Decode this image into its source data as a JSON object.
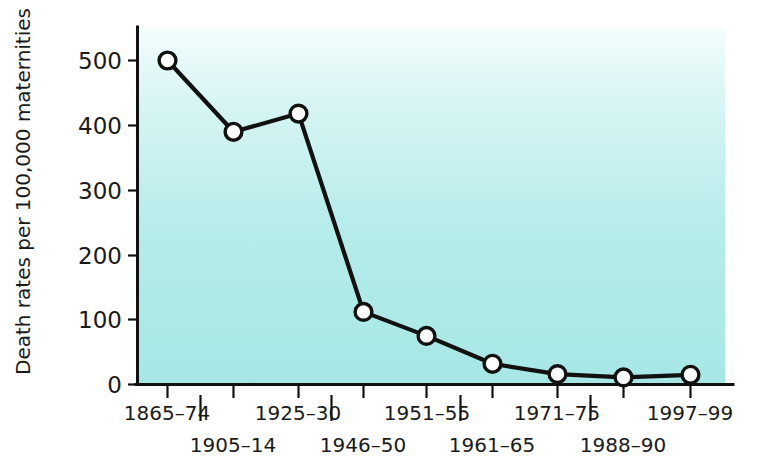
{
  "chart_data": {
    "type": "line",
    "title": "",
    "xlabel": "",
    "ylabel": "Death rates per 100,000 maternities",
    "categories": [
      "1865–74",
      "1905–14",
      "1925–30",
      "1946–50",
      "1951–55",
      "1961–65",
      "1971–75",
      "1988–90",
      "1997–99"
    ],
    "values": [
      500,
      390,
      418,
      112,
      75,
      32,
      16,
      11,
      15
    ],
    "ylim": [
      0,
      540
    ],
    "yticks": [
      0,
      100,
      200,
      300,
      400,
      500
    ],
    "ytick_labels": [
      "0",
      "100",
      "200",
      "300",
      "400",
      "500"
    ],
    "grid": false,
    "legend": null,
    "series": [
      {
        "name": "Maternal death rate",
        "values": [
          500,
          390,
          418,
          112,
          75,
          32,
          16,
          11,
          15
        ],
        "marker": "open-circle",
        "line_color": "#111111",
        "marker_fill": "#ffffff"
      }
    ],
    "plot_background_top": "#f2fdfd",
    "plot_background_bottom": "#a8e8e6",
    "axis_color": "#111111"
  },
  "axes": {
    "y_axis_label": "Death rates per 100,000 maternities",
    "y_tick_labels": [
      "500",
      "400",
      "300",
      "200",
      "100",
      "0"
    ],
    "x_tick_labels_upper_row": [
      "1865–74",
      "1925–30",
      "1951–55",
      "1971–75",
      "1997–99"
    ],
    "x_tick_labels_lower_row": [
      "1905–14",
      "1946–50",
      "1961–65",
      "1988–90"
    ]
  }
}
